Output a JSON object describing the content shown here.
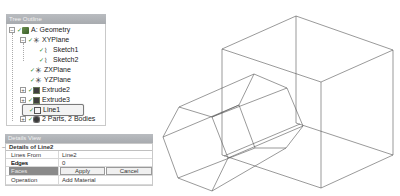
{
  "tree_outline": {
    "title": "Tree Outline",
    "items": [
      {
        "label": "A: Geometry",
        "level": 0,
        "expander": "−",
        "icon": "geometry-icon"
      },
      {
        "label": "XYPlane",
        "level": 1,
        "expander": "−",
        "icon": "plane-icon"
      },
      {
        "label": "Sketch1",
        "level": 2,
        "expander": "",
        "icon": "sketch-icon"
      },
      {
        "label": "Sketch2",
        "level": 2,
        "expander": "",
        "icon": "sketch-icon"
      },
      {
        "label": "ZXPlane",
        "level": 1,
        "expander": "",
        "icon": "plane-icon"
      },
      {
        "label": "YZPlane",
        "level": 1,
        "expander": "",
        "icon": "plane-icon"
      },
      {
        "label": "Extrude2",
        "level": 1,
        "expander": "+",
        "icon": "extrude-icon"
      },
      {
        "label": "Extrude3",
        "level": 1,
        "expander": "+",
        "icon": "extrude-icon"
      },
      {
        "label": "Line1",
        "level": 1,
        "expander": "",
        "icon": "line-body-icon",
        "selected": true
      },
      {
        "label": "2 Parts, 2 Bodies",
        "level": 1,
        "expander": "+",
        "icon": "parts-icon"
      }
    ]
  },
  "details_view": {
    "title": "Details View",
    "group_label": "Details of Line2",
    "rows": [
      {
        "label": "Lines From Edges",
        "value": "Line2"
      },
      {
        "label": "Edges",
        "value": "0"
      },
      {
        "label": "Faces",
        "apply_label": "Apply",
        "cancel_label": "Cancel"
      },
      {
        "label": "Operation",
        "value": "Add Material"
      }
    ]
  },
  "graphics": {
    "line_color": "#555555",
    "description": "Wireframe cube with hexagonal prism line body"
  }
}
